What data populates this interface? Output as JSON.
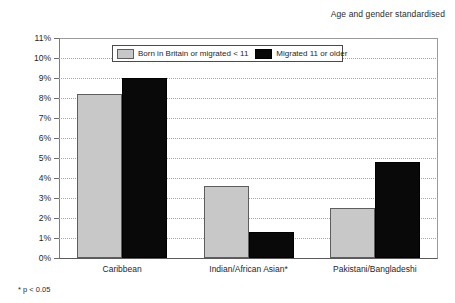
{
  "header": {
    "note": "Age and gender standardised"
  },
  "footnote": {
    "text": "* p < 0.05"
  },
  "legend": {
    "items": [
      {
        "label": "Born in Britain or migrated < 11",
        "color": "#c8c8c8",
        "swatch": "light"
      },
      {
        "label": "Migrated 11 or older",
        "color": "#080808",
        "swatch": "dark"
      }
    ]
  },
  "chart_data": {
    "type": "bar",
    "title": "",
    "subtitle": "Age and gender standardised",
    "xlabel": "",
    "ylabel": "",
    "ylim": [
      0,
      11
    ],
    "ytick_values": [
      0,
      1,
      2,
      3,
      4,
      5,
      6,
      7,
      8,
      9,
      10,
      11
    ],
    "ytick_labels": [
      "0%",
      "1%",
      "2%",
      "3%",
      "4%",
      "5%",
      "6%",
      "7%",
      "8%",
      "9%",
      "10%",
      "11%"
    ],
    "grid": true,
    "grid_axis": "y",
    "legend_position": "upper-center",
    "categories": [
      "Caribbean",
      "Indian/African Asian*",
      "Pakistani/Bangladeshi"
    ],
    "series": [
      {
        "name": "Born in Britain or migrated < 11",
        "color": "#c8c8c8",
        "values": [
          8.2,
          3.6,
          2.5
        ]
      },
      {
        "name": "Migrated 11 or older",
        "color": "#080808",
        "values": [
          9.0,
          1.3,
          4.8
        ]
      }
    ],
    "annotations": [
      "* p < 0.05"
    ]
  }
}
